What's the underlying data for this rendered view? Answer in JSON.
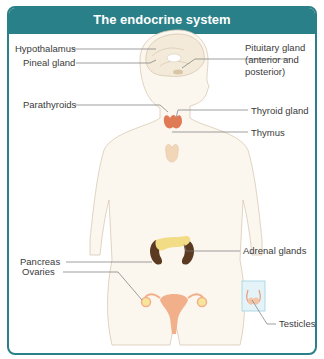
{
  "title": "The endocrine system",
  "labels": {
    "hypothalamus": "Hypothalamus",
    "pineal": "Pineal gland",
    "pituitary_1": "Pituitary gland",
    "pituitary_2": "(anterior and",
    "pituitary_3": "posterior)",
    "parathyroids": "Parathyroids",
    "thyroid": "Thyroid gland",
    "thymus": "Thymus",
    "pancreas": "Pancreas",
    "adrenal": "Adrenal glands",
    "ovaries": "Ovaries",
    "testicles": "Testicles"
  },
  "colors": {
    "accent": "#2a8088",
    "body_fill": "#fbf6ee",
    "body_outline": "#d9c9b4",
    "thyroid": "#e07a55",
    "thymus": "#f1d6b8",
    "kidney": "#5b3a22",
    "pancreas": "#f3dc86",
    "uterus": "#f2b08a",
    "leader_line": "#777777"
  }
}
